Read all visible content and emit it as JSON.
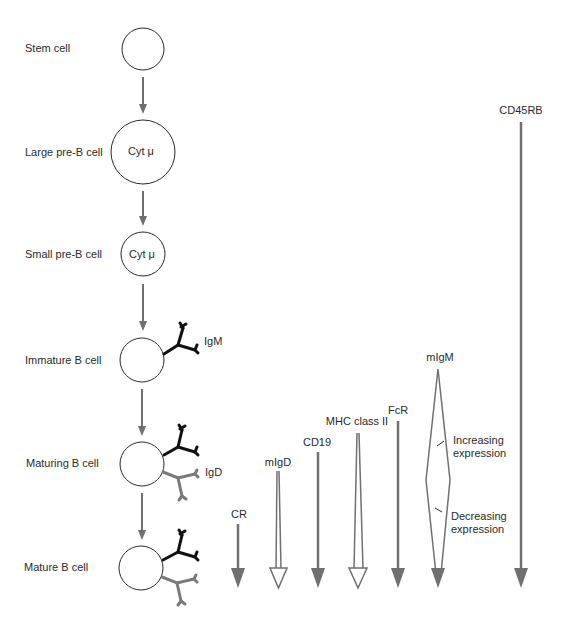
{
  "diagram": {
    "stages": [
      {
        "label": "Stem cell",
        "inner": ""
      },
      {
        "label": "Large pre-B cell",
        "inner": "Cyt μ"
      },
      {
        "label": "Small pre-B cell",
        "inner": "Cyt μ"
      },
      {
        "label": "Immature B cell",
        "inner": ""
      },
      {
        "label": "Maturing B cell",
        "inner": ""
      },
      {
        "label": "Mature B cell",
        "inner": ""
      }
    ],
    "immunoglobulins": {
      "igm": "IgM",
      "igd": "IgD"
    },
    "markers": [
      {
        "label": "CR",
        "style": "solid"
      },
      {
        "label": "mIgD",
        "style": "hollow"
      },
      {
        "label": "CD19",
        "style": "solid"
      },
      {
        "label": "MHC class II",
        "style": "hollow"
      },
      {
        "label": "FcR",
        "style": "solid"
      },
      {
        "label": "mIgM",
        "style": "diamond"
      },
      {
        "label": "CD45RB",
        "style": "solid"
      }
    ],
    "annotations": {
      "increasing": "Increasing expression",
      "increasing_line1": "Increasing",
      "increasing_line2": "expression",
      "decreasing": "Decreasing expression",
      "decreasing_line1": "Decreasing",
      "decreasing_line2": "expression"
    },
    "colors": {
      "arrow": "#707070",
      "outline": "#2a2a2a",
      "igm": "#111111",
      "igd": "#7a7a7a",
      "text": "#2a2a2a"
    }
  }
}
